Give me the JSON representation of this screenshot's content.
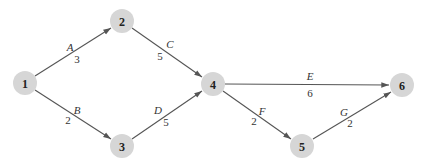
{
  "diagram": {
    "type": "activity-on-arrow network",
    "colors": {
      "node_fill": "#d6d6d6",
      "edge": "#555555",
      "text": "#222222",
      "background": "#ffffff"
    },
    "nodes": [
      {
        "id": "1",
        "label": "1",
        "x": 25,
        "y": 83
      },
      {
        "id": "2",
        "label": "2",
        "x": 122,
        "y": 21
      },
      {
        "id": "3",
        "label": "3",
        "x": 122,
        "y": 146
      },
      {
        "id": "4",
        "label": "4",
        "x": 213,
        "y": 84
      },
      {
        "id": "5",
        "label": "5",
        "x": 302,
        "y": 146
      },
      {
        "id": "6",
        "label": "6",
        "x": 402,
        "y": 85
      }
    ],
    "edges": [
      {
        "from": "1",
        "to": "2",
        "activity": "A",
        "duration": "3"
      },
      {
        "from": "1",
        "to": "3",
        "activity": "B",
        "duration": "2"
      },
      {
        "from": "2",
        "to": "4",
        "activity": "C",
        "duration": "5"
      },
      {
        "from": "3",
        "to": "4",
        "activity": "D",
        "duration": "5"
      },
      {
        "from": "4",
        "to": "6",
        "activity": "E",
        "duration": "6"
      },
      {
        "from": "4",
        "to": "5",
        "activity": "F",
        "duration": "2"
      },
      {
        "from": "5",
        "to": "6",
        "activity": "G",
        "duration": "2"
      }
    ]
  }
}
